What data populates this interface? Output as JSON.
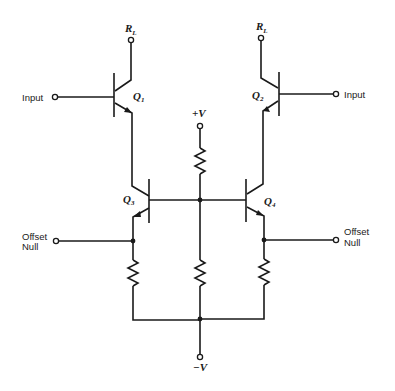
{
  "diagram": {
    "type": "circuit-schematic",
    "labels": {
      "rl_left": "R",
      "rl_left_sub": "L",
      "rl_right": "R",
      "rl_right_sub": "L",
      "input_left": "Input",
      "input_right": "Input",
      "q1": "Q",
      "q1_sub": "1",
      "q2": "Q",
      "q2_sub": "2",
      "q3": "Q",
      "q3_sub": "3",
      "q4": "Q",
      "q4_sub": "4",
      "vplus": "+V",
      "vminus": "−V",
      "offset_left_1": "Offset",
      "offset_left_2": "Null",
      "offset_right_1": "Offset",
      "offset_right_2": "Null"
    },
    "components": {
      "transistors": [
        "Q1",
        "Q2",
        "Q3",
        "Q4"
      ],
      "resistors": [
        "R_top_center",
        "R_emitter_Q3",
        "R_bottom_center",
        "R_emitter_Q4"
      ],
      "terminals": [
        "RL_left",
        "RL_right",
        "Input_left",
        "Input_right",
        "+V",
        "-V",
        "Offset_Null_left",
        "Offset_Null_right"
      ]
    },
    "colors": {
      "ink": "#1a1a1a",
      "background": "#ffffff"
    }
  }
}
